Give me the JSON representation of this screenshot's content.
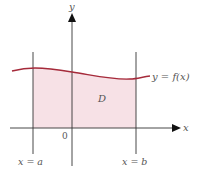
{
  "diagram": {
    "type": "region-under-curve",
    "axes": {
      "x_label": "x",
      "y_label": "y",
      "origin_label": "0"
    },
    "curve": {
      "label": "y = f(x)",
      "color": "#a52a3a"
    },
    "region": {
      "label": "D",
      "fill_color": "#f7e1e6"
    },
    "bounds": {
      "left_label": "x = a",
      "right_label": "x = b"
    },
    "line_color": "#333333"
  }
}
